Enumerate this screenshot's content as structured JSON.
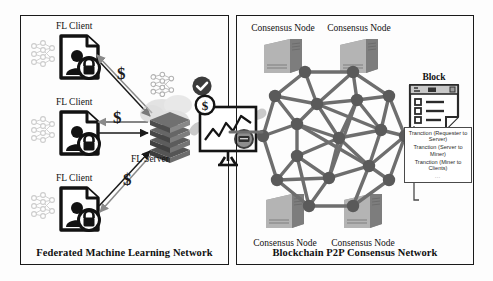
{
  "diagram": {
    "background": "#fdfdfd",
    "stroke": "#1a1a1a"
  },
  "left_panel": {
    "caption": "Federated Machine Learning Network",
    "clients": [
      {
        "label": "FL Client"
      },
      {
        "label": "FL Client"
      },
      {
        "label": "FL Client"
      }
    ],
    "server": {
      "label": "FL Server"
    },
    "money_markers": [
      "$",
      "$",
      "$"
    ],
    "icons": {
      "neural_net": "neural-network-icon",
      "document_user_lock": "secure-user-document-icon",
      "server_stack": "server-stack-icon",
      "check_badge": "check-badge-icon",
      "cloud": "cloud-icon",
      "chart_board": "chart-board-icon",
      "dollar_badge": "dollar-badge-icon"
    }
  },
  "right_panel": {
    "caption": "Blockchain P2P Consensus Network",
    "nodes": [
      {
        "label": "Consensus Node",
        "position": "top-left"
      },
      {
        "label": "Consensus Node",
        "position": "top-right"
      },
      {
        "label": "Consensus Node",
        "position": "bottom-left"
      },
      {
        "label": "Consensus Node",
        "position": "bottom-right"
      }
    ],
    "block": {
      "title": "Block",
      "transactions": [
        "Tranction (Requester to Server)",
        "Tranction (Server to Miner)",
        "Tranction (Miner to Clients)"
      ],
      "ellipsis": "…"
    },
    "icons": {
      "mesh_network": "p2p-mesh-network-icon",
      "server_tower": "server-tower-icon",
      "block_document": "block-document-icon"
    }
  },
  "colors": {
    "ink": "#1a1a1a",
    "grey_light": "#c9c9c9",
    "grey_mid": "#8f8f8f",
    "grey_dark": "#5e5e5e",
    "panel_border": "#1a1a1a"
  }
}
